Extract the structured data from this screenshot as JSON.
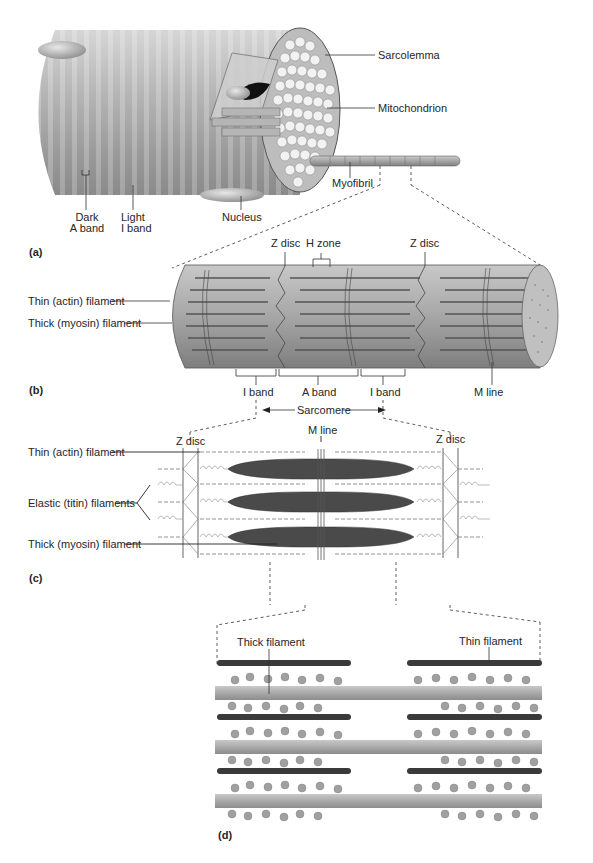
{
  "header": {
    "partial_text": ""
  },
  "panel_a": {
    "letter": "(a)",
    "labels": {
      "sarcolemma": "Sarcolemma",
      "mitochondrion": "Mitochondrion",
      "myofibril": "Myofibril",
      "dark_band_1": "Dark",
      "dark_band_2": "A band",
      "light_band_1": "Light",
      "light_band_2": "I band",
      "nucleus": "Nucleus"
    }
  },
  "panel_b": {
    "letter": "(b)",
    "labels": {
      "z_disc_left": "Z disc",
      "h_zone": "H zone",
      "z_disc_right": "Z disc",
      "thin_filament": "Thin (actin) filament",
      "thick_filament": "Thick (myosin) filament",
      "i_band_left": "I band",
      "a_band": "A band",
      "i_band_right": "I band",
      "m_line": "M line",
      "sarcomere": "Sarcomere"
    }
  },
  "panel_c": {
    "letter": "(c)",
    "labels": {
      "z_disc_left": "Z disc",
      "m_line": "M line",
      "z_disc_right": "Z disc",
      "thin_filament": "Thin (actin) filament",
      "elastic_filaments": "Elastic (titin) filaments",
      "thick_filament": "Thick (myosin) filament"
    }
  },
  "panel_d": {
    "letter": "(d)",
    "labels": {
      "thick_filament": "Thick filament",
      "thin_filament": "Thin filament"
    }
  },
  "colors": {
    "fiber_gray": "#a8a8a8",
    "dark_filament": "#3a3a3a",
    "myosin_gray": "#9a9a9a",
    "line": "#333333"
  }
}
